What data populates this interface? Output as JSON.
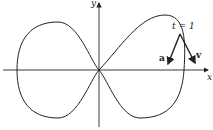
{
  "figure": {
    "axes": {
      "x_label": "x",
      "y_label": "y"
    },
    "point_label": "t = 1",
    "vectors": [
      {
        "name": "a",
        "label": "a"
      },
      {
        "name": "v",
        "label": "v"
      }
    ],
    "colors": {
      "stroke": "#222222",
      "background": "#ffffff"
    }
  }
}
